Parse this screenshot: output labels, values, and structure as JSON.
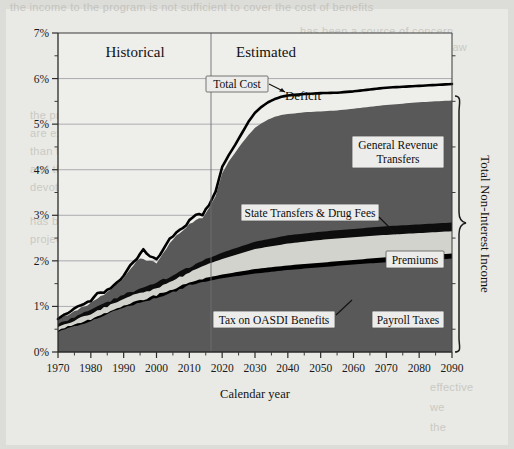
{
  "chart_data": {
    "type": "area",
    "title": "",
    "subtitle": "",
    "xlabel": "Calendar year",
    "ylabel": "",
    "xlim": [
      1970,
      2090
    ],
    "ylim": [
      0,
      7
    ],
    "grid": true,
    "legend_position": "inline-callouts",
    "y_tick_labels": [
      "0%",
      "1%",
      "2%",
      "3%",
      "4%",
      "5%",
      "6%",
      "7%"
    ],
    "y_ticks": [
      0,
      1,
      2,
      3,
      4,
      5,
      6,
      7
    ],
    "y_minor_tick_step": 0.5,
    "x_tick_labels": [
      "1970",
      "1980",
      "1990",
      "2000",
      "2010",
      "2020",
      "2030",
      "2040",
      "2050",
      "2060",
      "2070",
      "2080",
      "2090"
    ],
    "x_ticks": [
      1970,
      1980,
      1990,
      2000,
      2010,
      2020,
      2030,
      2040,
      2050,
      2060,
      2070,
      2080,
      2090
    ],
    "historical_estimated_split_year": 2016,
    "annotations": [
      {
        "name": "historical",
        "text": "Historical",
        "x": 1993
      },
      {
        "name": "estimated",
        "text": "Estimated",
        "x": 2035
      },
      {
        "name": "deficit",
        "text": "Deficit",
        "x": 2035,
        "y": 5.6
      },
      {
        "name": "total-non-interest-income",
        "text": "Total Non-Interest Income"
      }
    ],
    "series": [
      {
        "name": "Total Cost",
        "stacked": false,
        "style": "line",
        "color": "#000000",
        "x": [
          1970,
          1972,
          1974,
          1976,
          1978,
          1980,
          1982,
          1984,
          1986,
          1988,
          1990,
          1992,
          1994,
          1996,
          1998,
          2000,
          2002,
          2004,
          2006,
          2008,
          2010,
          2012,
          2014,
          2016,
          2018,
          2020,
          2022,
          2024,
          2026,
          2028,
          2030,
          2032,
          2034,
          2036,
          2038,
          2040,
          2045,
          2050,
          2055,
          2060,
          2065,
          2070,
          2075,
          2080,
          2085,
          2090
        ],
        "values": [
          0.72,
          0.78,
          0.88,
          1.0,
          1.05,
          1.12,
          1.28,
          1.32,
          1.36,
          1.42,
          1.68,
          1.9,
          2.04,
          2.22,
          2.12,
          2.02,
          2.28,
          2.44,
          2.62,
          2.7,
          2.88,
          3.0,
          3.02,
          3.22,
          3.52,
          4.06,
          4.32,
          4.55,
          4.8,
          5.05,
          5.25,
          5.38,
          5.48,
          5.55,
          5.6,
          5.63,
          5.66,
          5.68,
          5.69,
          5.72,
          5.76,
          5.8,
          5.82,
          5.84,
          5.86,
          5.88
        ]
      },
      {
        "name": "General Revenue Transfers",
        "stacked": true,
        "stack_order": 4,
        "color": "#595959",
        "x": [
          1970,
          1975,
          1980,
          1985,
          1990,
          1995,
          2000,
          2005,
          2010,
          2014,
          2016,
          2018,
          2020,
          2022,
          2024,
          2026,
          2028,
          2030,
          2032,
          2034,
          2036,
          2038,
          2040,
          2045,
          2050,
          2055,
          2060,
          2065,
          2070,
          2075,
          2080,
          2085,
          2090
        ],
        "top_values": [
          0.7,
          0.88,
          1.08,
          1.32,
          1.62,
          2.06,
          1.96,
          2.48,
          2.8,
          2.96,
          3.16,
          3.42,
          3.92,
          4.18,
          4.38,
          4.58,
          4.76,
          4.92,
          5.02,
          5.1,
          5.16,
          5.2,
          5.22,
          5.26,
          5.28,
          5.3,
          5.34,
          5.38,
          5.42,
          5.45,
          5.48,
          5.5,
          5.52
        ]
      },
      {
        "name": "State Transfers & Drug Fees",
        "stacked": true,
        "stack_order": 3,
        "color": "#0d0d0d",
        "x": [
          1970,
          1980,
          1990,
          2000,
          2010,
          2016,
          2020,
          2030,
          2040,
          2050,
          2060,
          2070,
          2080,
          2090
        ],
        "top_values": [
          0.62,
          0.92,
          1.26,
          1.52,
          1.86,
          2.06,
          2.18,
          2.42,
          2.56,
          2.64,
          2.7,
          2.76,
          2.8,
          2.84
        ]
      },
      {
        "name": "Premiums",
        "stacked": true,
        "stack_order": 2,
        "color": "#d3d3ce",
        "x": [
          1970,
          1980,
          1990,
          2000,
          2010,
          2016,
          2020,
          2030,
          2040,
          2050,
          2060,
          2070,
          2080,
          2090
        ],
        "top_values": [
          0.55,
          0.84,
          1.16,
          1.4,
          1.74,
          1.94,
          2.04,
          2.26,
          2.38,
          2.46,
          2.52,
          2.57,
          2.61,
          2.65
        ]
      },
      {
        "name": "Tax on OASDI Benefits",
        "stacked": true,
        "stack_order": 1,
        "color": "#000000",
        "x": [
          1970,
          1980,
          1990,
          1994,
          2000,
          2010,
          2016,
          2020,
          2030,
          2040,
          2050,
          2060,
          2070,
          2080,
          2090
        ],
        "top_values": [
          0.48,
          0.72,
          1.02,
          1.12,
          1.24,
          1.52,
          1.64,
          1.7,
          1.82,
          1.9,
          1.96,
          2.02,
          2.08,
          2.12,
          2.16
        ]
      },
      {
        "name": "Payroll Taxes",
        "stacked": true,
        "stack_order": 0,
        "color": "#595959",
        "x": [
          1970,
          1980,
          1990,
          2000,
          2010,
          2016,
          2020,
          2030,
          2040,
          2050,
          2060,
          2070,
          2080,
          2090
        ],
        "top_values": [
          0.45,
          0.68,
          0.98,
          1.18,
          1.46,
          1.56,
          1.62,
          1.72,
          1.8,
          1.86,
          1.92,
          1.97,
          2.01,
          2.05
        ]
      }
    ],
    "callouts": [
      {
        "name": "total-cost",
        "label": "Total Cost"
      },
      {
        "name": "general-revenue-transfers",
        "label_line1": "General Revenue",
        "label_line2": "Transfers"
      },
      {
        "name": "state-transfers-drug-fees",
        "label": "State Transfers & Drug Fees"
      },
      {
        "name": "premiums",
        "label": "Premiums"
      },
      {
        "name": "tax-on-oasdi-benefits",
        "label": "Tax on OASDI Benefits"
      },
      {
        "name": "payroll-taxes",
        "label": "Payroll Taxes"
      }
    ],
    "colors": {
      "area_dark_gray": "#595959",
      "area_black": "#000000",
      "area_light_gray": "#d3d3ce",
      "plot_background": "#eeeeea",
      "grid": "#8f8f95",
      "axis": "#2a2a2a",
      "page": "#e9e9e5"
    }
  },
  "axis": {
    "x_title": "Calendar year",
    "y_ticks": [
      "7%",
      "6%",
      "5%",
      "4%",
      "3%",
      "2%",
      "1%",
      "0%"
    ],
    "x_ticks": [
      "1970",
      "1980",
      "1990",
      "2000",
      "2010",
      "2020",
      "2030",
      "2040",
      "2050",
      "2060",
      "2070",
      "2080",
      "2090"
    ]
  },
  "labels": {
    "historical": "Historical",
    "estimated": "Estimated",
    "deficit": "Deficit",
    "total_cost": "Total Cost",
    "general_revenue_transfers_1": "General Revenue",
    "general_revenue_transfers_2": "Transfers",
    "state_transfers": "State Transfers & Drug Fees",
    "premiums": "Premiums",
    "tax_on_oasdi": "Tax on OASDI Benefits",
    "payroll_taxes": "Payroll Taxes",
    "total_non_interest_income": "Total Non-Interest Income"
  },
  "ghost": {
    "top": "the income to the program is not sufficient to cover the cost of benefits",
    "r1": "has been a source of concern",
    "r2": "and revenues under existing law",
    "r3": "income the program",
    "l1": "the program's expenditures",
    "l2": "are expected to grow faster",
    "l3": "than the economy as a whole",
    "l4": "and the share of the US budget",
    "l5": "devoted to the program",
    "l6": "has been rising and is",
    "l7": "projected to continue",
    "b1": "effective",
    "b2": "we",
    "b3": "the"
  }
}
